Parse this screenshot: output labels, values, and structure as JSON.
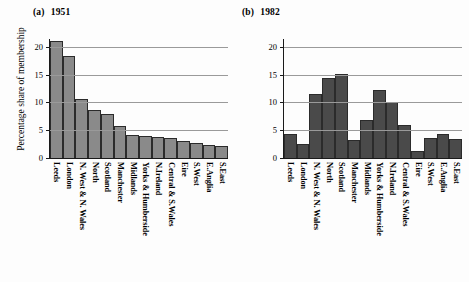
{
  "figure": {
    "ylabel": "Percentage share of membership"
  },
  "chart_data": [
    {
      "type": "bar",
      "panel_tag": "(a)",
      "title": "1951",
      "categories": [
        "Leeds",
        "London",
        "N. West & N. Wales",
        "North",
        "Scotland",
        "Manchester",
        "Midlands",
        "Yorks & Humberside",
        "N.Ireland",
        "Central & S.Wales",
        "Eire",
        "S.West",
        "E.Anglia",
        "S.East"
      ],
      "values": [
        21.0,
        18.3,
        10.6,
        8.7,
        7.9,
        5.8,
        4.1,
        3.9,
        3.8,
        3.6,
        3.0,
        2.7,
        2.4,
        2.2
      ],
      "xlabel": "",
      "ylabel": "Percentage share of membership",
      "ylim": [
        0,
        21.4
      ],
      "yticks": [
        0,
        5,
        10,
        15,
        20
      ],
      "ytick_labels": [
        "0",
        "5",
        "10",
        "15",
        "20"
      ],
      "grid": true,
      "legend": "none",
      "bar_color": "#8a8a8a"
    },
    {
      "type": "bar",
      "panel_tag": "(b)",
      "title": "1982",
      "categories": [
        "Leeds",
        "London",
        "N. West & N. Wales",
        "North",
        "Scotland",
        "Manchester",
        "Midlands",
        "Yorks & Humberside",
        "N.Ireland",
        "Central & S.Wales",
        "Eire",
        "S.West",
        "E.Anglia",
        "S.East"
      ],
      "values": [
        4.4,
        2.5,
        11.6,
        14.4,
        15.1,
        3.2,
        6.9,
        12.3,
        10.0,
        6.0,
        1.2,
        3.6,
        4.3,
        3.5
      ],
      "xlabel": "",
      "ylabel": "",
      "ylim": [
        0,
        21.4
      ],
      "yticks": [
        0,
        5,
        10,
        15,
        20
      ],
      "ytick_labels": [
        "0",
        "5",
        "10",
        "15",
        "20"
      ],
      "grid": true,
      "legend": "none",
      "bar_color": "#4a4a4a"
    }
  ]
}
